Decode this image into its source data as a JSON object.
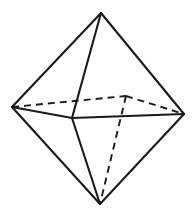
{
  "figure": {
    "kind": "geometric-solid-line-drawing",
    "background_color": "#ffffff",
    "line_color": "#1a1a1a",
    "solid_stroke_width": 2.1,
    "hidden_stroke_width": 1.9,
    "hidden_dash_pattern": "7 5",
    "canvas": {
      "width": 196,
      "height": 217
    },
    "vertices": [
      {
        "name": "apex-top",
        "label": "top",
        "x": 101,
        "y": 13,
        "visible": true
      },
      {
        "name": "vertex-left",
        "label": "left",
        "x": 12,
        "y": 107,
        "visible": true
      },
      {
        "name": "vertex-right",
        "label": "right",
        "x": 184,
        "y": 114,
        "visible": true
      },
      {
        "name": "vertex-front",
        "label": "front",
        "x": 72,
        "y": 118,
        "visible": true
      },
      {
        "name": "vertex-back",
        "label": "back-hidden",
        "x": 126,
        "y": 96,
        "visible": false
      },
      {
        "name": "apex-bottom",
        "label": "bottom",
        "x": 100,
        "y": 204,
        "visible": true
      }
    ],
    "edges_solid": [
      {
        "from": "apex-top",
        "to": "vertex-left",
        "x1": 101,
        "y1": 13,
        "x2": 12,
        "y2": 107
      },
      {
        "from": "apex-top",
        "to": "vertex-front",
        "x1": 101,
        "y1": 13,
        "x2": 72,
        "y2": 118
      },
      {
        "from": "apex-top",
        "to": "vertex-right",
        "x1": 101,
        "y1": 13,
        "x2": 184,
        "y2": 114
      },
      {
        "from": "vertex-left",
        "to": "vertex-front",
        "x1": 12,
        "y1": 107,
        "x2": 72,
        "y2": 118
      },
      {
        "from": "vertex-front",
        "to": "vertex-right",
        "x1": 72,
        "y1": 118,
        "x2": 184,
        "y2": 114
      },
      {
        "from": "vertex-left",
        "to": "apex-bottom",
        "x1": 12,
        "y1": 107,
        "x2": 100,
        "y2": 204
      },
      {
        "from": "vertex-front",
        "to": "apex-bottom",
        "x1": 72,
        "y1": 118,
        "x2": 100,
        "y2": 204
      },
      {
        "from": "vertex-right",
        "to": "apex-bottom",
        "x1": 184,
        "y1": 114,
        "x2": 100,
        "y2": 204
      }
    ],
    "edges_hidden": [
      {
        "from": "apex-top",
        "to": "vertex-back",
        "x1": 101,
        "y1": 13,
        "x2": 126,
        "y2": 96
      },
      {
        "from": "vertex-left",
        "to": "vertex-back",
        "x1": 12,
        "y1": 107,
        "x2": 126,
        "y2": 96
      },
      {
        "from": "vertex-back",
        "to": "vertex-right",
        "x1": 126,
        "y1": 96,
        "x2": 184,
        "y2": 114
      },
      {
        "from": "vertex-back",
        "to": "apex-bottom",
        "x1": 126,
        "y1": 96,
        "x2": 100,
        "y2": 204
      }
    ]
  }
}
